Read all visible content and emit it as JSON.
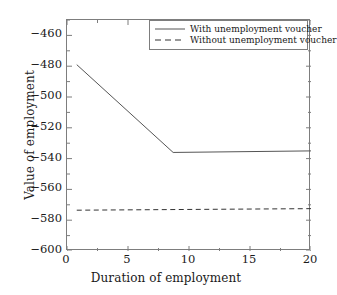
{
  "chart_data": {
    "type": "line",
    "title": "",
    "xlabel": "Duration of employment",
    "ylabel": "Value of employment",
    "xlim": [
      0,
      20
    ],
    "ylim": [
      -600,
      -450
    ],
    "xticks": [
      0,
      5,
      10,
      15,
      20
    ],
    "xtick_labels": [
      "0",
      "5",
      "10",
      "15",
      "20"
    ],
    "yticks": [
      -460,
      -480,
      -500,
      -520,
      -540,
      -560,
      -580,
      -600
    ],
    "ytick_labels": [
      "−460",
      "−480",
      "−500",
      "−520",
      "−540",
      "−560",
      "−580",
      "−600"
    ],
    "minor_xtick_interval": 2.5,
    "minor_ytick_interval": 10,
    "grid": false,
    "legend_position": "upper right",
    "series": [
      {
        "name": "With unemployment voucher",
        "style": "solid",
        "color": "#555555",
        "x": [
          0.8,
          8.7,
          20
        ],
        "y": [
          -479.0,
          -536.0,
          -535.0
        ]
      },
      {
        "name": "Without unemployment voucher",
        "style": "dashed",
        "color": "#333333",
        "x": [
          0.8,
          20
        ],
        "y": [
          -573.5,
          -572.5
        ]
      }
    ]
  },
  "legend": {
    "items": [
      {
        "label": "With unemployment voucher",
        "style": "solid"
      },
      {
        "label": "Without unemployment voucher",
        "style": "dashed"
      }
    ]
  }
}
